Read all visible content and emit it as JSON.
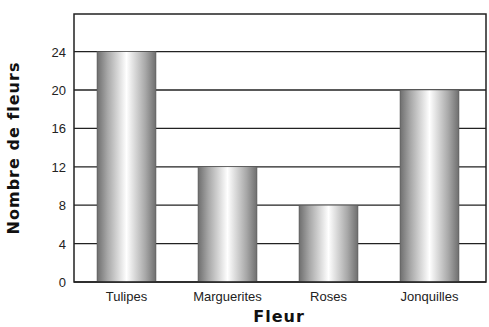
{
  "chart_data": {
    "type": "bar",
    "title": "",
    "xlabel": "Fleur",
    "ylabel": "Nombre de fleurs",
    "categories": [
      "Tulipes",
      "Marguerites",
      "Roses",
      "Jonquilles"
    ],
    "values": [
      24,
      12,
      8,
      20
    ],
    "ylim": [
      0,
      28
    ],
    "yticks": [
      0,
      4,
      8,
      12,
      16,
      20,
      24
    ],
    "grid": true,
    "legend": null,
    "bar_style": "grey cylindrical gradient"
  },
  "colors": {
    "axis": "#222222",
    "grid": "#222222",
    "bar_edge": "#6e6e6e",
    "bar_highlight": "#ffffff"
  }
}
